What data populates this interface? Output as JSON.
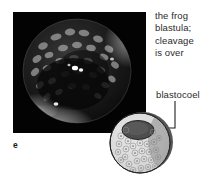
{
  "figure": {
    "letter": "e",
    "background_color": "#ffffff",
    "text_color": "#2b2b2b"
  },
  "photo": {
    "subject": "frog-blastula-micrograph",
    "background_color": "#030303",
    "sphere_fill": "#151515",
    "highlight_color": "#f2f2f2"
  },
  "caption": {
    "lines": [
      "the frog",
      "blastula;",
      "cleavage",
      "is over"
    ]
  },
  "annotation": {
    "label": "blastocoel",
    "leader_color": "#1f1f1f"
  },
  "diagram": {
    "name": "blastula-cutaway",
    "body_fill": "#dcdcdc",
    "shadow_fill": "#5a5a5a",
    "cavity_fill": "#4a4a4a",
    "outline_color": "#2a2a2a"
  }
}
